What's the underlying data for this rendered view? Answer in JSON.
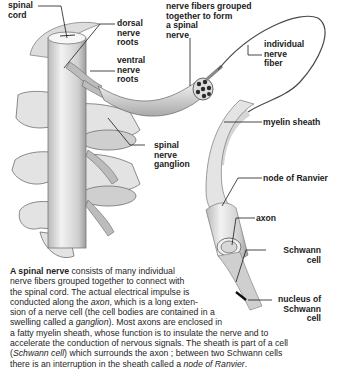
{
  "diagram": {
    "title": "A spinal nerve",
    "labels": {
      "spinal_cord": "spinal\ncord",
      "dorsal_roots": "dorsal\nnerve\nroots",
      "ventral_roots": "ventral\nnerve\nroots",
      "fibers_grouped": "nerve fibers grouped\ntogether to form\na spinal\nnerve",
      "individual_fiber": "individual\nnerve\nfiber",
      "myelin_sheath": "myelin sheath",
      "ganglion": "spinal\nnerve\nganglion",
      "node_ranvier": "node of Ranvier",
      "axon": "axon",
      "schwann_cell": "Schwann\ncell",
      "nucleus_schwann": "nucleus of\nSchwann\ncell"
    },
    "colors": {
      "tissue": "#e6e6e6",
      "shade": "#9a9a9a",
      "line": "#1a1a1a"
    }
  },
  "caption": {
    "lead": "A spinal nerve",
    "lines": [
      [
        {
          "t": "b",
          "v": "A spinal nerve"
        },
        {
          "t": "n",
          "v": " consists of many individual"
        }
      ],
      [
        {
          "t": "n",
          "v": "nerve fibers grouped together to connect with"
        }
      ],
      [
        {
          "t": "n",
          "v": "the spinal cord. The actual electrical impulse is"
        }
      ],
      [
        {
          "t": "n",
          "v": "conducted along the "
        },
        {
          "t": "i",
          "v": "axon"
        },
        {
          "t": "n",
          "v": ", which is a long exten-"
        }
      ],
      [
        {
          "t": "n",
          "v": "sion of a nerve cell (the cell bodies are contained in a"
        }
      ],
      [
        {
          "t": "n",
          "v": "swelling called a "
        },
        {
          "t": "i",
          "v": "ganglion"
        },
        {
          "t": "n",
          "v": "). Most axons are enclosed in"
        }
      ],
      [
        {
          "t": "n",
          "v": "a fatty myelin sheath, whose function is to insulate the nerve and to"
        }
      ],
      [
        {
          "t": "n",
          "v": "accelerate the conduction of nervous signals. The sheath is part of a cell"
        }
      ],
      [
        {
          "t": "n",
          "v": "("
        },
        {
          "t": "i",
          "v": "Schwann cell"
        },
        {
          "t": "n",
          "v": ") which surrounds the axon ; between two Schwann cells"
        }
      ],
      [
        {
          "t": "n",
          "v": "there is an interruption in the sheath called a "
        },
        {
          "t": "i",
          "v": "node of Ranvier"
        },
        {
          "t": "n",
          "v": "."
        }
      ]
    ]
  }
}
